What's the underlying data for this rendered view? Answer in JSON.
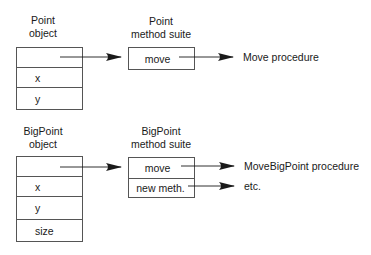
{
  "diagram": {
    "point": {
      "object_label": [
        "Point",
        "object"
      ],
      "object_fields": [
        "",
        "x",
        "y"
      ],
      "suite_label": [
        "Point",
        "method suite"
      ],
      "suite_methods": [
        "move"
      ],
      "targets": [
        "Move procedure"
      ]
    },
    "bigpoint": {
      "object_label": [
        "BigPoint",
        "object"
      ],
      "object_fields": [
        "",
        "x",
        "y",
        "size"
      ],
      "suite_label": [
        "BigPoint",
        "method suite"
      ],
      "suite_methods": [
        "move",
        "new meth."
      ],
      "targets": [
        "MoveBigPoint procedure",
        "etc."
      ]
    },
    "colors": {
      "line": "#1a1a1a",
      "border": "#555555",
      "text": "#1a1a1a"
    }
  }
}
